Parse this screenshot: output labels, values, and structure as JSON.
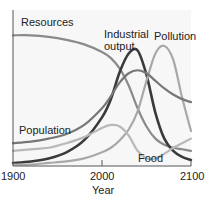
{
  "chart_data": {
    "type": "line",
    "title": "",
    "xlabel": "Year",
    "ylabel": "",
    "xlim": [
      1900,
      2100
    ],
    "ylim": [
      0,
      100
    ],
    "grid": false,
    "legend": "inline labels",
    "x_ticks": [
      "1900",
      "2000",
      "2100"
    ],
    "x": [
      1900,
      1920,
      1940,
      1960,
      1980,
      2000,
      2010,
      2020,
      2030,
      2040,
      2050,
      2060,
      2070,
      2080,
      2090,
      2100
    ],
    "series": [
      {
        "name": "Resources",
        "color": "#8a8a8a",
        "width": 2.2,
        "values": [
          86,
          86,
          85,
          83,
          80,
          75,
          71,
          64,
          53,
          38,
          26,
          18,
          14,
          12,
          11,
          10
        ]
      },
      {
        "name": "Industrial output",
        "color": "#3a3a3a",
        "width": 2.6,
        "values": [
          2,
          3,
          5,
          9,
          17,
          32,
          44,
          62,
          74,
          76,
          60,
          35,
          18,
          10,
          6,
          4
        ]
      },
      {
        "name": "Pollution",
        "color": "#a8a8a8",
        "width": 2.2,
        "values": [
          1,
          1,
          2,
          3,
          5,
          9,
          12,
          17,
          24,
          36,
          56,
          74,
          79,
          70,
          45,
          23
        ]
      },
      {
        "name": "Population",
        "color": "#777777",
        "width": 2.2,
        "values": [
          15,
          16,
          18,
          21,
          27,
          38,
          46,
          55,
          61,
          63,
          61,
          56,
          51,
          47,
          44,
          42
        ]
      },
      {
        "name": "Food",
        "color": "#b8b8b8",
        "width": 2.2,
        "values": [
          10,
          11,
          12,
          15,
          19,
          25,
          27,
          26,
          20,
          10,
          5,
          5,
          8,
          12,
          15,
          18
        ]
      }
    ],
    "labels": {
      "resources": "Resources",
      "industrial_1": "Industrial",
      "industrial_2": "output",
      "pollution": "Pollution",
      "population": "Population",
      "food": "Food"
    }
  }
}
